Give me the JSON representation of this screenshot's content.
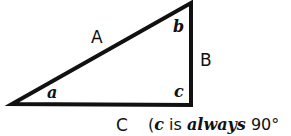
{
  "diagram": {
    "type": "right-triangle",
    "sides": {
      "hypotenuse": "A",
      "vertical": "B",
      "base": "C"
    },
    "angles": {
      "left": "a",
      "top": "b",
      "right": "c"
    },
    "caption": {
      "open": "(",
      "var": "c",
      "is": " is ",
      "always": "always",
      "value": " 90°"
    },
    "colors": {
      "stroke": "#111111",
      "background": "#ffffff"
    }
  }
}
